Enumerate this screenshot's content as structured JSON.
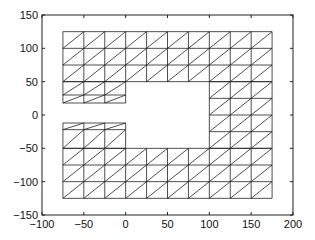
{
  "chart_data": {
    "type": "mesh",
    "title": "",
    "xlabel": "",
    "ylabel": "",
    "xlim": [
      -100,
      200
    ],
    "ylim": [
      -150,
      150
    ],
    "xticks": [
      -100,
      -50,
      0,
      50,
      100,
      150,
      200
    ],
    "yticks": [
      -150,
      -100,
      -50,
      0,
      50,
      100,
      150
    ],
    "grid": false,
    "line_color": "#222222",
    "regions": [
      {
        "name": "top-band",
        "x": [
          -75,
          -50,
          -25,
          0,
          25,
          50,
          75,
          100,
          125,
          150,
          175
        ],
        "y": [
          50,
          75,
          100,
          125
        ]
      },
      {
        "name": "upper-left-block",
        "x": [
          -75,
          -50,
          -25,
          0
        ],
        "y": [
          18,
          30,
          50
        ]
      },
      {
        "name": "right-column",
        "x": [
          100,
          125,
          150,
          175
        ],
        "y": [
          -50,
          -25,
          0,
          25,
          50
        ]
      },
      {
        "name": "bottom-band",
        "x": [
          -75,
          -50,
          -25,
          0,
          25,
          50,
          75,
          100,
          125,
          150,
          175
        ],
        "y": [
          -125,
          -100,
          -75,
          -50
        ]
      },
      {
        "name": "lower-left-block",
        "x": [
          -75,
          -50,
          -25,
          0
        ],
        "y": [
          -50,
          -22,
          -12
        ]
      }
    ]
  }
}
